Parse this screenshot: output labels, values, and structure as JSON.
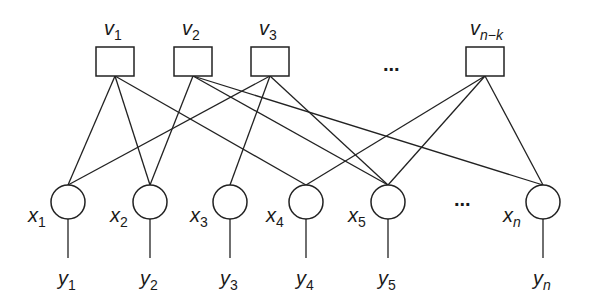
{
  "diagram": {
    "type": "factor-graph",
    "check_nodes": [
      {
        "id": "v1",
        "base": "v",
        "sub": "1",
        "cx": 115
      },
      {
        "id": "v2",
        "base": "v",
        "sub": "2",
        "cx": 193
      },
      {
        "id": "v3",
        "base": "v",
        "sub": "3",
        "cx": 270
      },
      {
        "id": "vnk",
        "base": "v",
        "sub": "n−k",
        "cx": 485
      }
    ],
    "variable_nodes": [
      {
        "id": "x1",
        "base": "x",
        "sub": "1",
        "cx": 68
      },
      {
        "id": "x2",
        "base": "x",
        "sub": "2",
        "cx": 150
      },
      {
        "id": "x3",
        "base": "x",
        "sub": "3",
        "cx": 230
      },
      {
        "id": "x4",
        "base": "x",
        "sub": "4",
        "cx": 306
      },
      {
        "id": "x5",
        "base": "x",
        "sub": "5",
        "cx": 388
      },
      {
        "id": "xn",
        "base": "x",
        "sub": "n",
        "cx": 543
      }
    ],
    "observations": [
      {
        "id": "y1",
        "base": "y",
        "sub": "1"
      },
      {
        "id": "y2",
        "base": "y",
        "sub": "2"
      },
      {
        "id": "y3",
        "base": "y",
        "sub": "3"
      },
      {
        "id": "y4",
        "base": "y",
        "sub": "4"
      },
      {
        "id": "y5",
        "base": "y",
        "sub": "5"
      },
      {
        "id": "yn",
        "base": "y",
        "sub": "n"
      }
    ],
    "edges": [
      [
        "v1",
        "x1"
      ],
      [
        "v1",
        "x2"
      ],
      [
        "v1",
        "x4"
      ],
      [
        "v2",
        "x2"
      ],
      [
        "v2",
        "x5"
      ],
      [
        "v2",
        "xn"
      ],
      [
        "v3",
        "x1"
      ],
      [
        "v3",
        "x3"
      ],
      [
        "v3",
        "x5"
      ],
      [
        "vnk",
        "x4"
      ],
      [
        "vnk",
        "x5"
      ],
      [
        "vnk",
        "xn"
      ]
    ],
    "ellipsis_top": "...",
    "ellipsis_bottom": "..."
  }
}
